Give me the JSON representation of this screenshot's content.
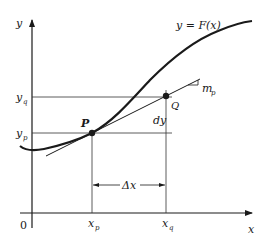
{
  "diagram": {
    "type": "derivative-tangent-graph",
    "axes": {
      "x_label": "x",
      "y_label": "y",
      "origin_label": "0"
    },
    "curve": {
      "label": "y = F(x)"
    },
    "points": {
      "p": {
        "label": "P",
        "x_label": "x",
        "x_sub": "p",
        "y_label": "y",
        "y_sub": "p"
      },
      "q": {
        "label": "Q",
        "x_label": "x",
        "x_sub": "q",
        "y_label": "y",
        "y_sub": "q"
      }
    },
    "tangent": {
      "slope_label": "m",
      "slope_sub": "p"
    },
    "annotations": {
      "dy_label": "dy",
      "delta_x_label": "Δx"
    },
    "colors": {
      "ink": "#1a1a1a",
      "thin_line": "#333333",
      "background": "#ffffff"
    }
  }
}
